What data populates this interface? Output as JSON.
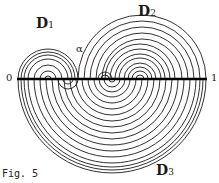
{
  "figure": {
    "caption": "Fig. 5",
    "labels": {
      "d1": {
        "main": "D",
        "sub": "1"
      },
      "d2": {
        "main": "D",
        "sub": "2"
      },
      "d3": {
        "main": "D",
        "sub": "3"
      },
      "alpha": "α",
      "left_end": "0",
      "right_end": "1"
    },
    "colors": {
      "ink": "#1a1a1a",
      "background": "#ffffff"
    }
  }
}
